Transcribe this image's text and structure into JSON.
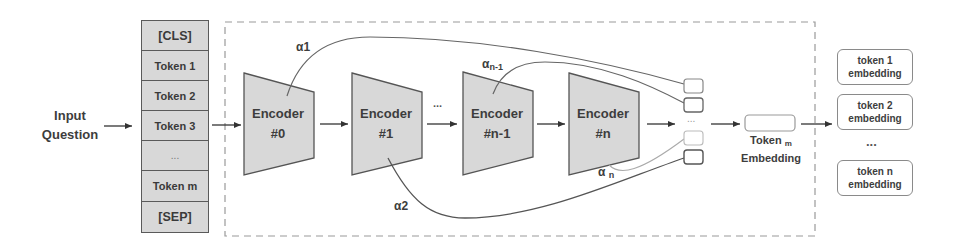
{
  "input": {
    "line1": "Input",
    "line2": "Question"
  },
  "tokens": [
    "[CLS]",
    "Token 1",
    "Token 2",
    "Token 3",
    "...",
    "Token m",
    "[SEP]"
  ],
  "encoders": [
    {
      "line1": "Encoder",
      "line2": "#0"
    },
    {
      "line1": "Encoder",
      "line2": "#1"
    },
    {
      "line1": "Encoder",
      "line2": "#n-1"
    },
    {
      "line1": "Encoder",
      "line2": "#n"
    }
  ],
  "between_dots": "...",
  "alphas": {
    "a1": "α1",
    "a2": "α2",
    "an1_base": "α",
    "an1_sub": "n-1",
    "an_base": "α",
    "an_sub": "n"
  },
  "pool_dots": "...",
  "token_m_embedding": {
    "base": "Token",
    "sub": "m",
    "line2": "Embedding"
  },
  "outputs": [
    {
      "line1": "token 1",
      "line2": "embedding"
    },
    {
      "line1": "token 2",
      "line2": "embedding"
    },
    {
      "line1": "token n",
      "line2": "embedding"
    }
  ],
  "output_dots": "...",
  "colors": {
    "fill_gray": "#d8d8d8",
    "stroke_dark": "#555555",
    "dashed": "#9a9a9a"
  }
}
